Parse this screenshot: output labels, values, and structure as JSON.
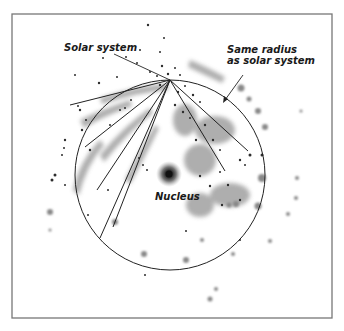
{
  "diagram": {
    "labels": {
      "solar_system": "Solar system",
      "same_radius_line1": "Same radius",
      "same_radius_line2": "as solar system",
      "nucleus": "Nucleus"
    },
    "colors": {
      "frame": "#777777",
      "lines": "#222222",
      "stars": "#333333",
      "nebula": "#9a9a9a",
      "nucleus_core": "#2a2a2a",
      "nucleus_halo": "#8a8a8a"
    },
    "circle": {
      "cx": 170,
      "cy": 175,
      "r": 95
    },
    "solar_system_point": {
      "x": 170,
      "y": 80
    },
    "rays": [
      {
        "x2": 70,
        "y2": 105
      },
      {
        "x2": 85,
        "y2": 147
      },
      {
        "x2": 97,
        "y2": 190
      },
      {
        "x2": 100,
        "y2": 238
      },
      {
        "x2": 113,
        "y2": 227
      },
      {
        "x2": 248,
        "y2": 151
      },
      {
        "x2": 225,
        "y2": 171
      }
    ]
  }
}
